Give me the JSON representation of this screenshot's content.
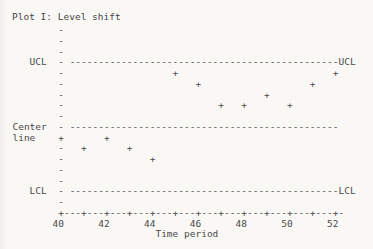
{
  "colors": {
    "background": "#f9f8f5",
    "ink": "#4b4b4b"
  },
  "chart_data": {
    "type": "scatter",
    "title": "Plot I: Level shift",
    "xlabel": "Time period",
    "marker": "+",
    "x_ticks": [
      40,
      42,
      44,
      46,
      48,
      50,
      52
    ],
    "x_range": [
      40,
      52
    ],
    "y_axis": {
      "labels": [
        "UCL",
        "Center line",
        "LCL"
      ],
      "note": "no numeric y scale; rows are text-grid lines, smaller row = higher value"
    },
    "reference_lines": [
      {
        "name": "UCL",
        "row": 4,
        "left_label": "UCL",
        "left_col": 5,
        "right_label": "UCL"
      },
      {
        "name": "Center line",
        "row": 10,
        "left_label": "Center",
        "left_col": 2,
        "left_label2": "line",
        "left2_row": 11,
        "left2_col": 2
      },
      {
        "name": "LCL",
        "row": 16,
        "left_label": "LCL",
        "left_col": 5,
        "right_label": "LCL"
      }
    ],
    "points": [
      {
        "x": 40,
        "row": 11
      },
      {
        "x": 41,
        "row": 12
      },
      {
        "x": 42,
        "row": 11
      },
      {
        "x": 43,
        "row": 12
      },
      {
        "x": 44,
        "row": 13
      },
      {
        "x": 45,
        "row": 5
      },
      {
        "x": 46,
        "row": 6
      },
      {
        "x": 47,
        "row": 8
      },
      {
        "x": 48,
        "row": 8
      },
      {
        "x": 49,
        "row": 7
      },
      {
        "x": 50,
        "row": 8
      },
      {
        "x": 51,
        "row": 6
      },
      {
        "x": 52,
        "row": 5
      }
    ]
  },
  "grid": {
    "cols": 62,
    "pre_rows": 20,
    "axis_col": 10,
    "x_start": 40,
    "cols_per_unit": 4,
    "dash_start_col": 12,
    "dash_end_col": 58,
    "right_label_col": 59,
    "axis_row": 18,
    "axis_end_col": 59,
    "tick_label_row": 19,
    "xlabel_row": 20,
    "xlabel_col": 27
  }
}
